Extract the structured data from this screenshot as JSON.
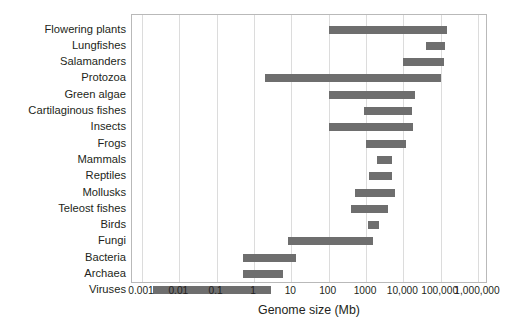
{
  "chart_data": {
    "type": "bar",
    "subtype": "horizontal-range-bar",
    "title": "",
    "xlabel": "Genome size (Mb)",
    "ylabel": "",
    "xscale": "log",
    "xlim": [
      0.001,
      1000000
    ],
    "xticks": [
      0.001,
      0.01,
      0.1,
      1,
      10,
      100,
      1000,
      10000,
      100000,
      1000000
    ],
    "xticklabels": [
      "0.001",
      "0.01",
      "0.1",
      "1",
      "10",
      "100",
      "1000",
      "10,000",
      "100,000",
      "1,000,000"
    ],
    "grid": "vertical",
    "legend": "none",
    "bar_color": "#6e6e6e",
    "grid_color": "#dcdcdc",
    "axis_color": "#b9b9b9",
    "text_color": "#231f20",
    "categories": [
      "Flowering plants",
      "Lungfishes",
      "Salamanders",
      "Protozoa",
      "Green algae",
      "Cartilaginous fishes",
      "Insects",
      "Frogs",
      "Mammals",
      "Reptiles",
      "Mollusks",
      "Teleost fishes",
      "Birds",
      "Fungi",
      "Bacteria",
      "Archaea",
      "Viruses"
    ],
    "ranges": [
      [
        100,
        150000
      ],
      [
        40000,
        130000
      ],
      [
        10000,
        120000
      ],
      [
        2,
        100000
      ],
      [
        100,
        20000
      ],
      [
        900,
        17000
      ],
      [
        100,
        18000
      ],
      [
        1000,
        12000
      ],
      [
        2000,
        5000
      ],
      [
        1200,
        5000
      ],
      [
        500,
        6000
      ],
      [
        400,
        4000
      ],
      [
        1100,
        2200
      ],
      [
        8,
        1500
      ],
      [
        0.5,
        13
      ],
      [
        0.5,
        6
      ],
      [
        0.002,
        2.8
      ]
    ],
    "bars": [
      {
        "category": "Flowering plants",
        "min": 100,
        "max": 150000
      },
      {
        "category": "Lungfishes",
        "min": 40000,
        "max": 130000
      },
      {
        "category": "Salamanders",
        "min": 10000,
        "max": 120000
      },
      {
        "category": "Protozoa",
        "min": 2,
        "max": 100000
      },
      {
        "category": "Green algae",
        "min": 100,
        "max": 20000
      },
      {
        "category": "Cartilaginous fishes",
        "min": 900,
        "max": 17000
      },
      {
        "category": "Insects",
        "min": 100,
        "max": 18000
      },
      {
        "category": "Frogs",
        "min": 1000,
        "max": 12000
      },
      {
        "category": "Mammals",
        "min": 2000,
        "max": 5000
      },
      {
        "category": "Reptiles",
        "min": 1200,
        "max": 5000
      },
      {
        "category": "Mollusks",
        "min": 500,
        "max": 6000
      },
      {
        "category": "Teleost fishes",
        "min": 400,
        "max": 4000
      },
      {
        "category": "Birds",
        "min": 1100,
        "max": 2200
      },
      {
        "category": "Fungi",
        "min": 8,
        "max": 1500
      },
      {
        "category": "Bacteria",
        "min": 0.5,
        "max": 13
      },
      {
        "category": "Archaea",
        "min": 0.5,
        "max": 6
      },
      {
        "category": "Viruses",
        "min": 0.002,
        "max": 2.8
      }
    ]
  }
}
